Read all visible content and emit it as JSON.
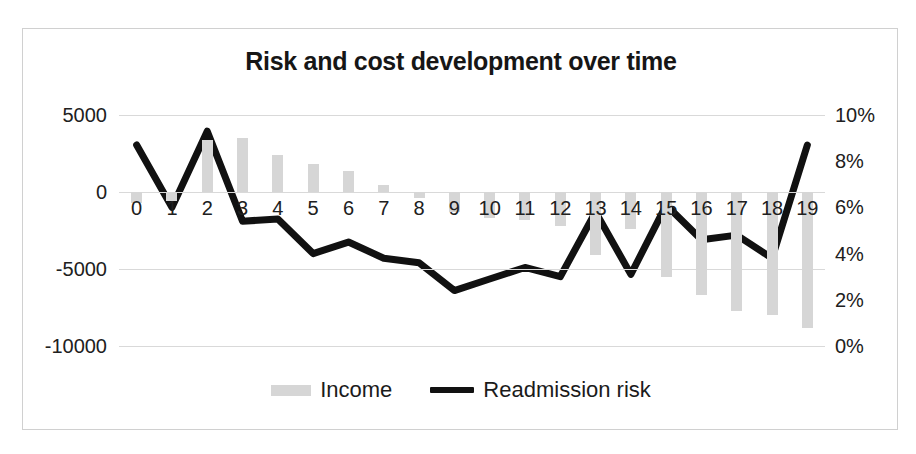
{
  "chart_data": {
    "type": "bar",
    "title": "Risk and cost development over time",
    "xlabel": "",
    "ylabel": "",
    "grid": true,
    "legend_position": "bottom",
    "categories": [
      "0",
      "1",
      "2",
      "3",
      "4",
      "5",
      "6",
      "7",
      "8",
      "9",
      "10",
      "11",
      "12",
      "13",
      "14",
      "15",
      "16",
      "17",
      "18",
      "19"
    ],
    "axes": {
      "left": {
        "name": "Income",
        "ylim": [
          -10000,
          5000
        ],
        "ticks": [
          5000,
          0,
          -5000,
          -10000
        ],
        "tick_labels": [
          "5000",
          "0",
          "-5000",
          "-10000"
        ]
      },
      "right": {
        "name": "Readmission risk",
        "ylim": [
          0,
          10
        ],
        "unit": "%",
        "ticks": [
          10,
          8,
          6,
          4,
          2,
          0
        ],
        "tick_labels": [
          "10%",
          "8%",
          "6%",
          "4%",
          "2%",
          "0%"
        ]
      }
    },
    "series": [
      {
        "name": "Income",
        "type": "bar",
        "axis": "left",
        "color": "#d6d6d6",
        "values": [
          -700,
          -600,
          3400,
          3500,
          2400,
          1800,
          1350,
          450,
          -400,
          -1300,
          -1700,
          -1800,
          -2200,
          -4100,
          -2400,
          -5500,
          -6700,
          -7700,
          -8000,
          -8800
        ]
      },
      {
        "name": "Readmission risk",
        "type": "line",
        "axis": "right",
        "color": "#111111",
        "unit": "%",
        "values": [
          8.7,
          6.0,
          9.3,
          5.4,
          5.5,
          4.0,
          4.5,
          3.8,
          3.6,
          2.4,
          2.9,
          3.4,
          3.0,
          5.8,
          3.1,
          6.1,
          4.6,
          4.8,
          3.8,
          8.7
        ]
      }
    ]
  },
  "legend": {
    "items": [
      {
        "label": "Income",
        "marker": "bar-swatch"
      },
      {
        "label": "Readmission risk",
        "marker": "line-swatch"
      }
    ]
  }
}
